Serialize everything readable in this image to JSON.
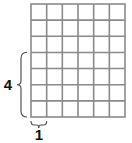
{
  "diagram": {
    "type": "grid-area-model",
    "grid": {
      "columns": 6,
      "rows": 7,
      "x": 31,
      "y": 4,
      "width": 94,
      "height": 113,
      "line_color": "#8a8a8a",
      "fill_color": "#ffffff"
    },
    "brace_left": {
      "label": "4",
      "spans_rows": 4,
      "from_row": 3,
      "to_row": 7
    },
    "brace_bottom": {
      "label": "1",
      "spans_columns": 1
    },
    "brace_color": "#555555",
    "label_color": "#111111"
  }
}
